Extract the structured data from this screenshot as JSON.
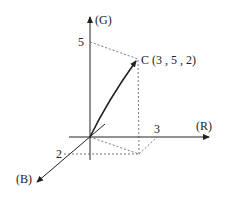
{
  "diagram": {
    "axes": {
      "g": {
        "label": "(G)",
        "tick_label": "5"
      },
      "r": {
        "label": "(R)",
        "tick_label": "3"
      },
      "b": {
        "label": "(B)",
        "tick_label": "2"
      }
    },
    "point": {
      "label": "C (3 , 5 , 2)",
      "name": "C",
      "coords": [
        3,
        5,
        2
      ]
    },
    "colors": {
      "line": "#222222",
      "dashed": "#555555",
      "background": "#ffffff"
    }
  }
}
